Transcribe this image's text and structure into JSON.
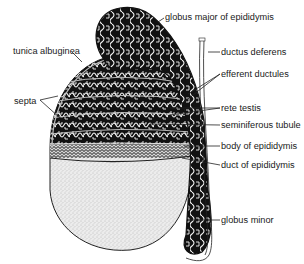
{
  "diagram": {
    "labels": {
      "globus_major": "globus major of epididymis",
      "tunica_albuginea": "tunica albuginea",
      "ductus_deferens": "ductus deferens",
      "efferent_ductules": "efferent ductules",
      "septa": "septa",
      "rete_testis": "rete testis",
      "seminiferous_tubule": "seminiferous tubule",
      "body_of_epididymis": "body of epididymis",
      "duct_of_epididymis": "duct of epididymis",
      "globus_minor": "globus minor"
    },
    "colors": {
      "ink": "#111111",
      "tubule": "#f2f2f2",
      "stipple": "#d9d9d9",
      "background": "#ffffff"
    }
  }
}
